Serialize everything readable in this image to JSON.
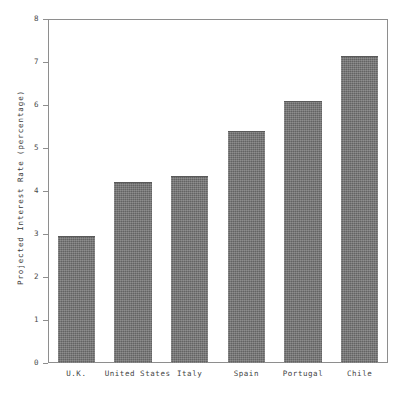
{
  "chart_data": {
    "type": "bar",
    "title": "",
    "subtitle": "",
    "xlabel": "",
    "ylabel": "Projected Interest Rate (percentage)",
    "categories": [
      "U.K.",
      "United States",
      "Italy",
      "Spain",
      "Portugal",
      "Chile"
    ],
    "values": [
      2.95,
      4.2,
      4.35,
      5.4,
      6.1,
      7.15
    ],
    "series": [
      {
        "name": "Projected Interest Rate",
        "values": [
          2.95,
          4.2,
          4.35,
          5.4,
          6.1,
          7.15
        ]
      }
    ],
    "ylim": [
      0,
      8
    ],
    "ytick_labels": [
      "0",
      "1",
      "2",
      "3",
      "4",
      "5",
      "6",
      "7",
      "8"
    ],
    "ytick_values": [
      0,
      1,
      2,
      3,
      4,
      5,
      6,
      7,
      8
    ],
    "grid": false,
    "legend": false,
    "legend_position": "none",
    "bar_color": "#6e6e6e",
    "frame_color": "#8e8e8e",
    "background_color": "#ffffff"
  }
}
